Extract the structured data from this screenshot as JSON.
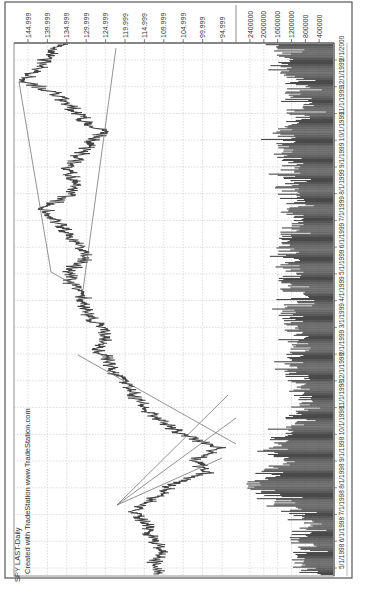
{
  "chart_data": {
    "type": "line",
    "orientation": "rotated-90-ccw",
    "title": "SPY LAST-Daily",
    "subtitle": "Created with TradeStation www.TradeStation.com",
    "xlabel": "",
    "ylabel": "",
    "x_tick_labels": [
      "5/1/1998",
      "6/1/1998",
      "7/1/1998",
      "8/1/1998",
      "9/1/1998",
      "10/1/1998",
      "11/1/1998",
      "12/1/1998",
      "2/1/1999",
      "3/1/1999",
      "4/1/1999",
      "5/1/1999",
      "6/1/1999",
      "7/1/1999",
      "8/1/1999",
      "9/1/1999",
      "10/1/1999",
      "11/1/1999",
      "12/1/1999",
      "2/1/2000"
    ],
    "price_axis": {
      "tick_labels": [
        "144.999",
        "139.999",
        "134.999",
        "129.999",
        "124.999",
        "119.999",
        "114.999",
        "109.999",
        "104.999",
        "99.999",
        "94.999"
      ],
      "ylim": [
        92,
        147
      ]
    },
    "volume_axis": {
      "tick_labels": [
        "2400000",
        "2000000",
        "1600000",
        "1200000",
        "800000",
        "400000"
      ],
      "ylim": [
        0,
        2800000
      ]
    },
    "grid": true,
    "series": [
      {
        "name": "SPY Daily Price (approx.)",
        "x": [
          "5/1/1998",
          "5/15/1998",
          "6/1/1998",
          "6/15/1998",
          "7/1/1998",
          "7/17/1998",
          "8/1/1998",
          "8/15/1998",
          "8/31/1998",
          "9/15/1998",
          "10/8/1998",
          "10/20/1998",
          "11/1/1998",
          "11/20/1998",
          "12/1/1998",
          "12/20/1998",
          "1/1/1999",
          "1/20/1999",
          "2/1/1999",
          "2/15/1999",
          "3/1/1999",
          "3/20/1999",
          "4/1/1999",
          "4/15/1999",
          "5/1/1999",
          "5/15/1999",
          "6/1/1999",
          "6/20/1999",
          "7/1/1999",
          "7/16/1999",
          "8/1/1999",
          "8/15/1999",
          "9/1/1999",
          "9/15/1999",
          "10/1/1999",
          "10/15/1999",
          "11/1/1999",
          "11/20/1999",
          "12/1/1999",
          "12/31/1999",
          "1/15/2000",
          "2/1/2000",
          "2/15/2000"
        ],
        "values": [
          112,
          112,
          111,
          113,
          115,
          118,
          113,
          108,
          99,
          102,
          96,
          105,
          110,
          115,
          117,
          120,
          123,
          125,
          127,
          125,
          128,
          130,
          131,
          134,
          134,
          130,
          132,
          135,
          138,
          141,
          134,
          133,
          135,
          132,
          129,
          126,
          131,
          134,
          138,
          146,
          142,
          140,
          135
        ]
      },
      {
        "name": "Volume (approx.)",
        "values": [
          700000,
          900000,
          800000,
          1000000,
          900000,
          1200000,
          1600000,
          2500000,
          1800000,
          1500000,
          1900000,
          1400000,
          1100000,
          1000000,
          900000,
          1000000,
          1100000,
          1200000,
          1000000,
          1100000,
          1200000,
          1300000,
          1000000,
          1400000,
          1300000,
          1200000,
          1500000,
          1300000,
          1200000,
          1100000,
          1300000,
          1400000,
          1200000,
          1300000,
          1500000,
          1400000,
          1000000,
          900000,
          1100000,
          1000000,
          1600000,
          1400000,
          1800000
        ]
      }
    ],
    "annotations": [
      {
        "type": "trendline-fan",
        "origin": "7/17/1998 high",
        "count": 3
      },
      {
        "type": "trendline",
        "desc": "downtrend line from Jan 1999 to Oct 1998 low"
      },
      {
        "type": "channel",
        "desc": "broadening channel Mar 1999 - Feb 2000"
      }
    ]
  },
  "header": {
    "title": "SPY LAST-Daily",
    "credit": "Created with TradeStation www.TradeStation.com"
  },
  "colors": {
    "price": "#444444",
    "volume": "#4a4a4a",
    "grid": "#bdbdbd",
    "frame": "#555555",
    "trendline": "#777777"
  }
}
